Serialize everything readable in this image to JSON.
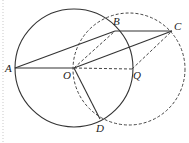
{
  "diagram": {
    "points": {
      "A": {
        "label": "A",
        "x": 15,
        "y": 68
      },
      "B": {
        "label": "B",
        "x": 115,
        "y": 31
      },
      "C": {
        "label": "C",
        "x": 172,
        "y": 31
      },
      "O": {
        "label": "O",
        "x": 74,
        "y": 68
      },
      "Q": {
        "label": "Q",
        "x": 132,
        "y": 69
      },
      "D": {
        "label": "D",
        "x": 100,
        "y": 119
      }
    },
    "circles": [
      {
        "name": "circle-O",
        "center": "O",
        "style": "solid"
      },
      {
        "name": "circle-Q",
        "center": "Q",
        "style": "dashed"
      }
    ],
    "solid_segments": [
      "AB",
      "BC",
      "AO",
      "OC",
      "OD"
    ],
    "dashed_segments": [
      "OB",
      "OQ",
      "QC",
      "OD-arc"
    ]
  }
}
